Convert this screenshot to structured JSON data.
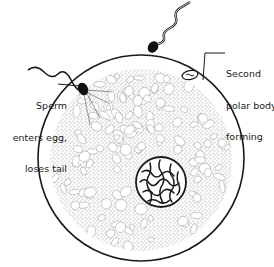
{
  "figure": {
    "labels": {
      "sperm_entry": [
        "Sperm",
        "enters egg,",
        "loses tail"
      ],
      "polar_body": [
        "Second",
        "polar body",
        "forming"
      ]
    },
    "elements": [
      {
        "name": "egg-membrane",
        "description": "outer egg cell boundary"
      },
      {
        "name": "cytoplasm",
        "description": "stippled granular cytoplasm with yolk vacuoles"
      },
      {
        "name": "nucleus",
        "description": "egg nucleus with chromatin network"
      },
      {
        "name": "sperm-entering",
        "description": "sperm head at membrane, tail outside"
      },
      {
        "name": "sperm-approaching",
        "description": "free-swimming sperm above egg"
      },
      {
        "name": "polar-body",
        "description": "second polar body forming at top right"
      }
    ],
    "colors": {
      "ink": "#1a1a1a",
      "background": "#ffffff",
      "stipple": "#555555"
    }
  }
}
